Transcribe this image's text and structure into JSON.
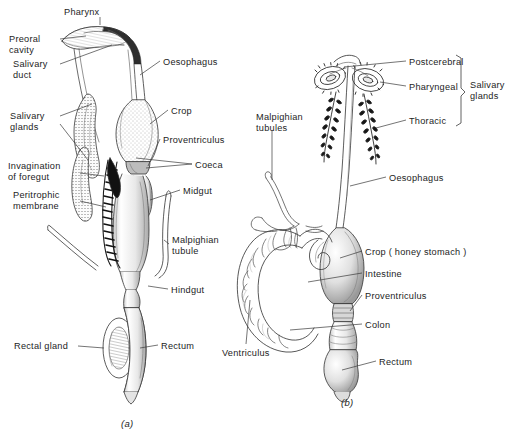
{
  "figure": {
    "background_color": "#ffffff",
    "ink_color": "#1d1d1d",
    "panels": [
      {
        "caption": "(a)",
        "caption_pos": {
          "x": 121,
          "y": 418
        },
        "labels": [
          {
            "name": "pharynx",
            "text": "Pharynx",
            "x": 64,
            "y": 7,
            "align": "left"
          },
          {
            "name": "preoral-cavity",
            "text": "Preoral\ncavity",
            "x": 9,
            "y": 34,
            "align": "left"
          },
          {
            "name": "salivary-duct",
            "text": "Salivary\nduct",
            "x": 13,
            "y": 59,
            "align": "left"
          },
          {
            "name": "salivary-glands",
            "text": "Salivary\nglands",
            "x": 10,
            "y": 111,
            "align": "left"
          },
          {
            "name": "invagination-of-foregut",
            "text": "Invagination\nof foregut",
            "x": 8,
            "y": 161,
            "align": "left"
          },
          {
            "name": "peritrophic-membrane",
            "text": "Peritrophic\nmembrane",
            "x": 13,
            "y": 190,
            "align": "left"
          },
          {
            "name": "rectal-gland",
            "text": "Rectal gland",
            "x": 14,
            "y": 341,
            "align": "left"
          },
          {
            "name": "oesophagus",
            "text": "Oesophagus",
            "x": 163,
            "y": 57,
            "align": "left"
          },
          {
            "name": "crop",
            "text": "Crop",
            "x": 171,
            "y": 106,
            "align": "left"
          },
          {
            "name": "proventriculus",
            "text": "Proventriculus",
            "x": 163,
            "y": 135,
            "align": "left"
          },
          {
            "name": "coeca",
            "text": "Coeca",
            "x": 195,
            "y": 160,
            "align": "left"
          },
          {
            "name": "midgut",
            "text": "Midgut",
            "x": 183,
            "y": 186,
            "align": "left"
          },
          {
            "name": "malpighian-tubule",
            "text": "Malpighian\ntubule",
            "x": 172,
            "y": 235,
            "align": "left"
          },
          {
            "name": "hindgut",
            "text": "Hindgut",
            "x": 171,
            "y": 285,
            "align": "left"
          },
          {
            "name": "rectum",
            "text": "Rectum",
            "x": 161,
            "y": 341,
            "align": "left"
          }
        ]
      },
      {
        "caption": "(b)",
        "caption_pos": {
          "x": 341,
          "y": 397
        },
        "labels": [
          {
            "name": "postcerebral",
            "text": "Postcerebral",
            "x": 409,
            "y": 57,
            "align": "left"
          },
          {
            "name": "pharyngeal",
            "text": "Pharyngeal",
            "x": 409,
            "y": 82,
            "align": "left"
          },
          {
            "name": "thoracic",
            "text": "Thoracic",
            "x": 409,
            "y": 116,
            "align": "left"
          },
          {
            "name": "malpighian-tubules",
            "text": "Malpighian\ntubules",
            "x": 256,
            "y": 112,
            "align": "left"
          },
          {
            "name": "oesophagus",
            "text": "Oesophagus",
            "x": 389,
            "y": 173,
            "align": "left"
          },
          {
            "name": "crop-honey-stomach",
            "text": "Crop ( honey stomach )",
            "x": 365,
            "y": 247,
            "align": "left"
          },
          {
            "name": "intestine",
            "text": "Intestine",
            "x": 365,
            "y": 269,
            "align": "left"
          },
          {
            "name": "proventriculus",
            "text": "Proventriculus",
            "x": 365,
            "y": 291,
            "align": "left"
          },
          {
            "name": "colon",
            "text": "Colon",
            "x": 365,
            "y": 320,
            "align": "left"
          },
          {
            "name": "rectum",
            "text": "Rectum",
            "x": 379,
            "y": 357,
            "align": "left"
          },
          {
            "name": "ventriculus",
            "text": "Ventriculus",
            "x": 222,
            "y": 348,
            "align": "left"
          }
        ],
        "bracket_group": {
          "label": "Salivary\nglands",
          "x": 470,
          "y": 80,
          "bracket_top": 55,
          "bracket_bottom": 126,
          "bracket_x": 461
        }
      }
    ]
  }
}
